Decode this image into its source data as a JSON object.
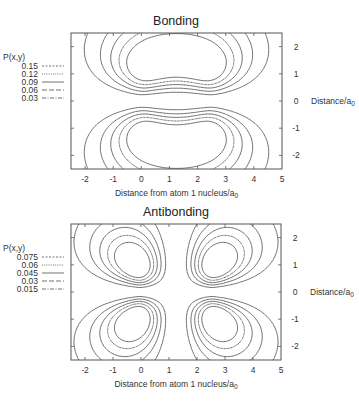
{
  "chart_data": [
    {
      "type": "contour",
      "title": "Bonding",
      "xlabel": "Distance from atom 1 nucleus/a",
      "xlabel_sub": "0",
      "ylabel": "Distance/a",
      "ylabel_sub": "0",
      "xlim": [
        -2.5,
        5
      ],
      "ylim": [
        -2.5,
        2.5
      ],
      "xticks": [
        "-2",
        "-1",
        "0",
        "1",
        "2",
        "3",
        "4",
        "5"
      ],
      "yticks": [
        "2",
        "1",
        "0",
        "-1",
        "-2"
      ],
      "legend_title": "P(x,y)",
      "legend_position": "left",
      "nuclei_x": [
        0,
        2.5
      ],
      "combination": "sum",
      "levels": [
        {
          "value": "0.15",
          "dash": "2,1.5"
        },
        {
          "value": "0.12",
          "dash": "1,1.2"
        },
        {
          "value": "0.09",
          "dash": "none"
        },
        {
          "value": "0.06",
          "dash": "5,2"
        },
        {
          "value": "0.03",
          "dash": "4,1.5,1,1.5"
        }
      ]
    },
    {
      "type": "contour",
      "title": "Antibonding",
      "xlabel": "Distance from atom 1 nucleus/a",
      "xlabel_sub": "0",
      "ylabel": "Distance/a",
      "ylabel_sub": "0",
      "xlim": [
        -2.5,
        5
      ],
      "ylim": [
        -2.5,
        2.5
      ],
      "xticks": [
        "-2",
        "-1",
        "0",
        "1",
        "2",
        "3",
        "4",
        "5"
      ],
      "yticks": [
        "2",
        "1",
        "0",
        "-1",
        "-2"
      ],
      "legend_title": "P(x,y)",
      "legend_position": "left",
      "nuclei_x": [
        0,
        2.5
      ],
      "combination": "difference",
      "levels": [
        {
          "value": "0.075",
          "dash": "2,1.5"
        },
        {
          "value": "0.06",
          "dash": "1,1.2"
        },
        {
          "value": "0.045",
          "dash": "none"
        },
        {
          "value": "0.03",
          "dash": "5,2"
        },
        {
          "value": "0.015",
          "dash": "4,1.5,1,1.5"
        }
      ]
    }
  ]
}
